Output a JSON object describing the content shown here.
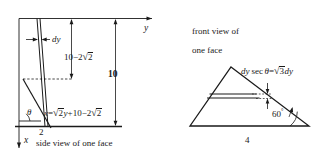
{
  "figure": {
    "title_left": "side view of one face",
    "title_right_line1": "front view of",
    "title_right_line2": "one face",
    "left_diagram": {
      "axis_y_label": "y",
      "axis_x_label": "x",
      "strip_label": "dy",
      "dim_upper": "10−2√2",
      "dim_total": "10",
      "base_label": "2",
      "angle_label": "θ",
      "curve_equation": "x = √2 y + 10 − 2√2",
      "eq_parts": {
        "lhs": "x",
        "equals": "=",
        "rad1": "√",
        "rad1_arg": "2",
        "var_y": "y",
        "plus": "+",
        "const": "10",
        "minus": "−",
        "coef": "2",
        "rad2": "√",
        "rad2_arg": "2"
      },
      "dim_upper_parts": {
        "const": "10",
        "minus": "−",
        "coef": "2",
        "rad": "√",
        "rad_arg": "2"
      }
    },
    "right_diagram": {
      "angle_label": "60",
      "angle_degree_symbol": "°",
      "base_label": "4",
      "thickness_label": "dy sec θ = √3 dy",
      "thickness_parts": {
        "dy": "dy",
        "sec": "sec",
        "theta": "θ",
        "equals": "=",
        "rad": "√",
        "rad_arg": "3",
        "dy2": "dy"
      }
    },
    "colors": {
      "stroke": "#1a1a1a",
      "text": "#1a1a1a",
      "background": "#ffffff"
    }
  }
}
